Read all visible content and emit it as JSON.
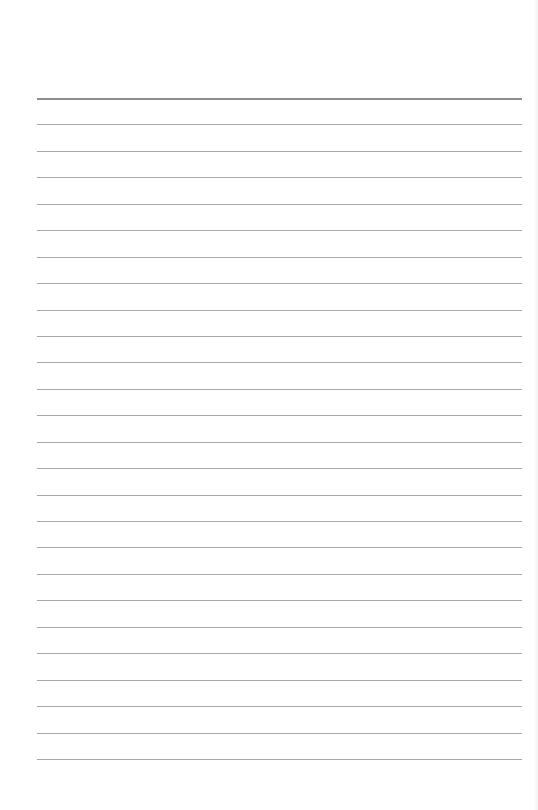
{
  "page": {
    "type": "lined-paper",
    "line_count": 26,
    "first_line_y": 98,
    "line_spacing": 26.44,
    "line_left": 37,
    "line_right": 522,
    "line_color": "#a8a8a8",
    "top_line_color": "#8f8f8f",
    "background": "#ffffff"
  }
}
